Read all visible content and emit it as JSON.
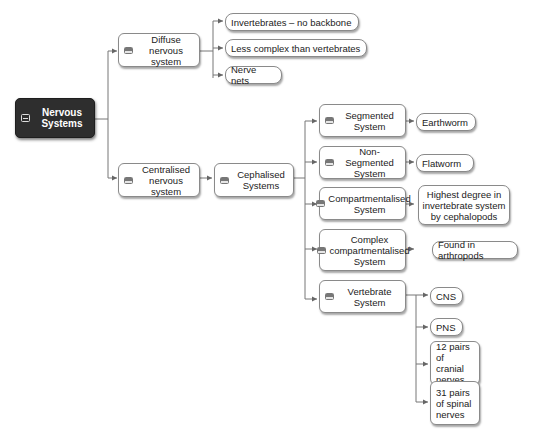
{
  "diagram": {
    "type": "mind-map",
    "root": {
      "label": "Nervous Systems",
      "icon": "collapse-icon"
    },
    "diffuse": {
      "label": "Diffuse nervous system",
      "children": [
        "Invertebrates – no backbone",
        "Less complex than vertebrates",
        "Nerve nets"
      ]
    },
    "centralised": {
      "label": "Centralised nervous system",
      "cephalised": {
        "label": "Cephalised Systems",
        "segmented": {
          "label": "Segmented System",
          "child": "Earthworm"
        },
        "non_segmented": {
          "label": "Non-Segmented System",
          "child": "Flatworm"
        },
        "compartmentalised": {
          "label": "Compartmentalised System",
          "child": "Highest degree in invertebrate system by cephalopods"
        },
        "complex": {
          "label": "Complex compartmentalised System",
          "child": "Found in arthropods"
        },
        "vertebrate": {
          "label": "Vertebrate System",
          "children": [
            "CNS",
            "PNS",
            "12 pairs of cranial nerves",
            "31 pairs of spinal nerves"
          ]
        }
      }
    }
  },
  "colors": {
    "root_bg": "#2e2e2e",
    "node_border": "#8a8a8a",
    "connector": "#666666"
  }
}
